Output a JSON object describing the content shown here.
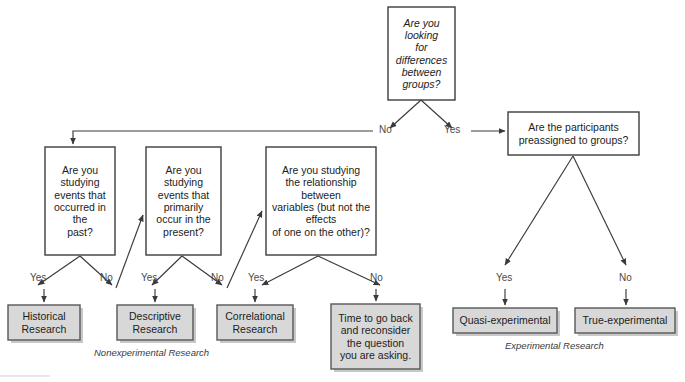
{
  "diagram": {
    "colors": {
      "decision_fill": "#ffffff",
      "decision_stroke": "#3d3d3d",
      "outcome_fill": "#d8d8d8",
      "outcome_stroke": "#575757",
      "connector": "#3a3a3a",
      "label_text": "#4a4a4a",
      "body_text": "#1c1c1c"
    },
    "root": {
      "id": "root-question",
      "text": "Are you\nlooking\nfor\ndifferences\nbetween\ngroups?"
    },
    "decisions": [
      {
        "id": "historical-question",
        "text": "Are you\nstudying\nevents that\noccurred in\nthe\npast?"
      },
      {
        "id": "descriptive-question",
        "text": "Are you\nstudying\nevents that\nprimarily\noccur in the\npresent?"
      },
      {
        "id": "correlational-question",
        "text": "Are you studying\nthe relationship\nbetween\nvariables (but not the\neffects\nof one on the other)?"
      },
      {
        "id": "preassigned-question",
        "text": "Are the participants\npreassigned to groups?"
      }
    ],
    "outcomes": [
      {
        "id": "historical-research",
        "text": "Historical\nResearch"
      },
      {
        "id": "descriptive-research",
        "text": "Descriptive\nResearch"
      },
      {
        "id": "correlational-research",
        "text": "Correlational\nResearch"
      },
      {
        "id": "reconsider-note",
        "text": "Time to go back\nand reconsider\nthe question\nyou are asking."
      },
      {
        "id": "quasi-experimental",
        "text": "Quasi-experimental"
      },
      {
        "id": "true-experimental",
        "text": "True-experimental"
      }
    ],
    "edge_labels": {
      "root_no": "No",
      "root_yes": "Yes",
      "historical_yes": "Yes",
      "historical_no": "No",
      "descriptive_yes": "Yes",
      "descriptive_no": "No",
      "correlational_yes": "Yes",
      "correlational_no": "No",
      "preassigned_yes": "Yes",
      "preassigned_no": "No"
    },
    "group_labels": {
      "nonexperimental": "Nonexperimental Research",
      "experimental": "Experimental Research"
    }
  }
}
